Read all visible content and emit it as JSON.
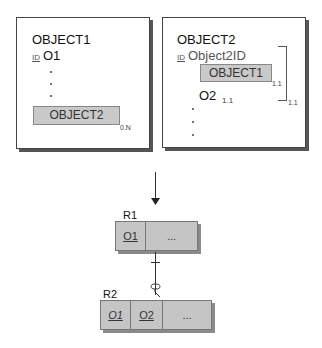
{
  "object1_card": {
    "title": "OBJECT1",
    "id_tag": "ID",
    "id_attr": "O1",
    "nested_object": "OBJECT2",
    "nested_cardinality": "0.N"
  },
  "object2_card": {
    "title": "OBJECT2",
    "id_tag": "ID",
    "id_attr": "Object2ID",
    "nested_object": "OBJECT1",
    "nested_cardinality": "1.1",
    "attr": "O2",
    "attr_cardinality": "1.1",
    "group_cardinality": "1.1"
  },
  "relations": [
    {
      "name": "R1",
      "columns": [
        {
          "label": "O1",
          "underline": true,
          "italic": false
        },
        {
          "label": "...",
          "underline": false,
          "italic": false
        }
      ]
    },
    {
      "name": "R2",
      "columns": [
        {
          "label": "O1",
          "underline": true,
          "italic": true
        },
        {
          "label": "O2",
          "underline": true,
          "italic": false
        },
        {
          "label": "...",
          "underline": false,
          "italic": false
        }
      ]
    }
  ],
  "colors": {
    "relation_fill": "#c5c5c5",
    "nested_fill": "#c9c9c9",
    "border": "#444444"
  }
}
